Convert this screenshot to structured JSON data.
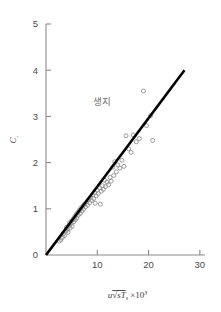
{
  "chart_data": {
    "type": "scatter",
    "title": "",
    "xlabel": "u√sTₛ ×10³",
    "ylabel": "Cₐ",
    "xlim": [
      0,
      31
    ],
    "ylim": [
      0,
      5
    ],
    "grid": false,
    "legend": null,
    "xticks": [
      10,
      20,
      30
    ],
    "xtick_labels": [
      "10",
      "20",
      "30"
    ],
    "yticks": [
      0,
      1,
      2,
      3,
      4,
      5
    ],
    "ytick_labels": [
      "0",
      "1",
      "2",
      "3",
      "4",
      "5"
    ],
    "annotations": [
      {
        "text": "생지",
        "x": 11.0,
        "y": 3.25
      }
    ],
    "series": [
      {
        "name": "observations",
        "type": "scatter",
        "marker": "open-circle",
        "color": "#8d8d8d",
        "points": [
          [
            2.6,
            0.3
          ],
          [
            2.9,
            0.33
          ],
          [
            3.2,
            0.38
          ],
          [
            3.4,
            0.46
          ],
          [
            3.6,
            0.42
          ],
          [
            3.9,
            0.52
          ],
          [
            4.0,
            0.6
          ],
          [
            4.2,
            0.56
          ],
          [
            4.3,
            0.49
          ],
          [
            4.5,
            0.64
          ],
          [
            4.6,
            0.7
          ],
          [
            4.7,
            0.58
          ],
          [
            4.9,
            0.68
          ],
          [
            5.0,
            0.74
          ],
          [
            5.1,
            0.62
          ],
          [
            5.3,
            0.78
          ],
          [
            5.4,
            0.72
          ],
          [
            5.6,
            0.83
          ],
          [
            5.7,
            0.76
          ],
          [
            5.9,
            0.88
          ],
          [
            6.0,
            0.8
          ],
          [
            6.2,
            0.92
          ],
          [
            6.3,
            0.86
          ],
          [
            6.5,
            0.97
          ],
          [
            6.7,
            0.9
          ],
          [
            6.8,
            1.02
          ],
          [
            7.0,
            0.95
          ],
          [
            7.2,
            1.06
          ],
          [
            7.3,
            0.99
          ],
          [
            7.5,
            1.1
          ],
          [
            7.7,
            1.04
          ],
          [
            7.9,
            1.15
          ],
          [
            8.1,
            1.08
          ],
          [
            8.3,
            1.2
          ],
          [
            8.5,
            1.13
          ],
          [
            8.7,
            1.25
          ],
          [
            8.9,
            1.18
          ],
          [
            9.1,
            1.3
          ],
          [
            9.3,
            1.22
          ],
          [
            9.5,
            1.35
          ],
          [
            9.6,
            1.12
          ],
          [
            9.8,
            1.28
          ],
          [
            10.0,
            1.4
          ],
          [
            10.2,
            1.33
          ],
          [
            10.4,
            1.45
          ],
          [
            10.6,
            1.1
          ],
          [
            10.8,
            1.38
          ],
          [
            11.0,
            1.5
          ],
          [
            11.2,
            1.42
          ],
          [
            11.4,
            1.62
          ],
          [
            11.6,
            1.48
          ],
          [
            11.9,
            1.58
          ],
          [
            12.2,
            1.52
          ],
          [
            12.5,
            1.68
          ],
          [
            12.7,
            1.6
          ],
          [
            13.0,
            1.9
          ],
          [
            13.2,
            1.72
          ],
          [
            13.4,
            2.02
          ],
          [
            13.7,
            1.8
          ],
          [
            14.0,
            1.95
          ],
          [
            14.4,
            1.88
          ],
          [
            14.8,
            2.05
          ],
          [
            15.2,
            1.92
          ],
          [
            15.6,
            2.58
          ],
          [
            16.1,
            2.3
          ],
          [
            16.6,
            2.22
          ],
          [
            17.0,
            2.6
          ],
          [
            17.6,
            2.45
          ],
          [
            18.2,
            2.52
          ],
          [
            19.0,
            3.55
          ],
          [
            19.6,
            2.8
          ],
          [
            20.4,
            3.02
          ],
          [
            20.8,
            2.48
          ]
        ]
      },
      {
        "name": "regression-line",
        "type": "line",
        "color": "#000000",
        "x": [
          0,
          27
        ],
        "y": [
          0,
          4.0
        ]
      }
    ]
  }
}
